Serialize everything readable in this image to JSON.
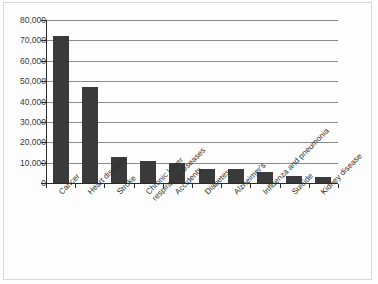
{
  "chart_data": {
    "type": "bar",
    "title": "",
    "subtitle": "",
    "xlabel": "",
    "ylabel": "",
    "ylim": [
      0,
      80000
    ],
    "ytick_labels": [
      "80,000",
      "70,000",
      "60,000",
      "50,000",
      "40,000",
      "30,000",
      "20,000",
      "10,000",
      "0"
    ],
    "ytick_values": [
      80000,
      70000,
      60000,
      50000,
      40000,
      30000,
      20000,
      10000,
      0
    ],
    "grid": true,
    "legend": false,
    "legend_position": "none",
    "bar_color": "#3a3a3a",
    "axis_color": "#2b2b2b",
    "gridline_color": "#8c8c8c",
    "categories": [
      "Cancer",
      "Heart disease",
      "Stroke",
      "Chronic lower\nrespiratory diseases",
      "Accidents",
      "Diabetes",
      "Alzheimer's",
      "Influenza and pneumonia",
      "Suicide",
      "Kidney disease"
    ],
    "values": [
      72000,
      47000,
      13000,
      11000,
      10000,
      7000,
      7000,
      5500,
      3500,
      3000
    ]
  }
}
